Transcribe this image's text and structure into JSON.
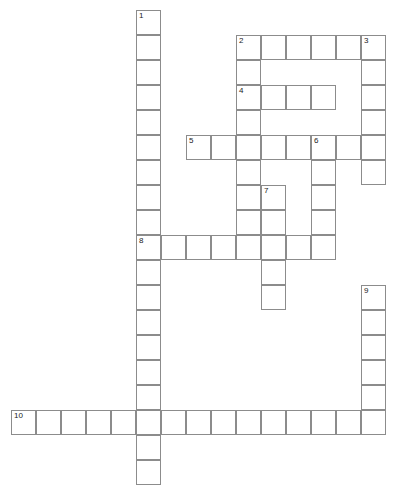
{
  "puzzle": {
    "title": "Crossword puzzle grid",
    "grid": {
      "cell_size": 25,
      "origin_x": 11,
      "origin_y": 10,
      "columns": 16,
      "rows": 19,
      "line_color": "#8c8c8c",
      "cell_fill": "#ffffff",
      "background": "#ffffff",
      "number_color": "#1a1a1a"
    },
    "entries": [
      {
        "number": "1",
        "direction": "down",
        "start_col": 5,
        "start_row": 0,
        "length": 18,
        "value": ""
      },
      {
        "number": "2",
        "direction": "across",
        "start_col": 9,
        "start_row": 1,
        "length": 5,
        "value": ""
      },
      {
        "number": "2",
        "direction": "down",
        "start_col": 9,
        "start_row": 1,
        "length": 8,
        "value": ""
      },
      {
        "number": "3",
        "direction": "down",
        "start_col": 14,
        "start_row": 1,
        "length": 6,
        "value": ""
      },
      {
        "number": "4",
        "direction": "across",
        "start_col": 9,
        "start_row": 3,
        "length": 4,
        "value": ""
      },
      {
        "number": "5",
        "direction": "across",
        "start_col": 7,
        "start_row": 5,
        "length": 7,
        "value": ""
      },
      {
        "number": "6",
        "direction": "down",
        "start_col": 12,
        "start_row": 5,
        "length": 5,
        "value": ""
      },
      {
        "number": "7",
        "direction": "down",
        "start_col": 10,
        "start_row": 7,
        "length": 5,
        "value": ""
      },
      {
        "number": "8",
        "direction": "across",
        "start_col": 5,
        "start_row": 9,
        "length": 8,
        "value": ""
      },
      {
        "number": "9",
        "direction": "down",
        "start_col": 14,
        "start_row": 11,
        "length": 6,
        "value": ""
      },
      {
        "number": "10",
        "direction": "across",
        "start_col": 0,
        "start_row": 16,
        "length": 15,
        "value": ""
      }
    ],
    "cells": [
      {
        "col": 5,
        "row": 0,
        "number": "1"
      },
      {
        "col": 5,
        "row": 1
      },
      {
        "col": 9,
        "row": 1,
        "number": "2"
      },
      {
        "col": 10,
        "row": 1
      },
      {
        "col": 11,
        "row": 1
      },
      {
        "col": 12,
        "row": 1
      },
      {
        "col": 13,
        "row": 1
      },
      {
        "col": 14,
        "row": 1,
        "number": "3"
      },
      {
        "col": 5,
        "row": 2
      },
      {
        "col": 9,
        "row": 2
      },
      {
        "col": 14,
        "row": 2
      },
      {
        "col": 5,
        "row": 3
      },
      {
        "col": 9,
        "row": 3,
        "number": "4"
      },
      {
        "col": 10,
        "row": 3
      },
      {
        "col": 11,
        "row": 3
      },
      {
        "col": 12,
        "row": 3
      },
      {
        "col": 14,
        "row": 3
      },
      {
        "col": 5,
        "row": 4
      },
      {
        "col": 9,
        "row": 4
      },
      {
        "col": 14,
        "row": 4
      },
      {
        "col": 5,
        "row": 5
      },
      {
        "col": 7,
        "row": 5,
        "number": "5"
      },
      {
        "col": 8,
        "row": 5
      },
      {
        "col": 9,
        "row": 5
      },
      {
        "col": 10,
        "row": 5
      },
      {
        "col": 11,
        "row": 5
      },
      {
        "col": 12,
        "row": 5,
        "number": "6"
      },
      {
        "col": 13,
        "row": 5
      },
      {
        "col": 14,
        "row": 5
      },
      {
        "col": 5,
        "row": 6
      },
      {
        "col": 9,
        "row": 6
      },
      {
        "col": 12,
        "row": 6
      },
      {
        "col": 14,
        "row": 6
      },
      {
        "col": 5,
        "row": 7
      },
      {
        "col": 9,
        "row": 7
      },
      {
        "col": 10,
        "row": 7,
        "number": "7"
      },
      {
        "col": 12,
        "row": 7
      },
      {
        "col": 5,
        "row": 8
      },
      {
        "col": 9,
        "row": 8
      },
      {
        "col": 10,
        "row": 8
      },
      {
        "col": 12,
        "row": 8
      },
      {
        "col": 5,
        "row": 9,
        "number": "8"
      },
      {
        "col": 6,
        "row": 9
      },
      {
        "col": 7,
        "row": 9
      },
      {
        "col": 8,
        "row": 9
      },
      {
        "col": 9,
        "row": 9
      },
      {
        "col": 10,
        "row": 9
      },
      {
        "col": 11,
        "row": 9
      },
      {
        "col": 12,
        "row": 9
      },
      {
        "col": 5,
        "row": 10
      },
      {
        "col": 10,
        "row": 10
      },
      {
        "col": 5,
        "row": 11
      },
      {
        "col": 10,
        "row": 11
      },
      {
        "col": 14,
        "row": 11,
        "number": "9"
      },
      {
        "col": 5,
        "row": 12
      },
      {
        "col": 14,
        "row": 12
      },
      {
        "col": 5,
        "row": 13
      },
      {
        "col": 14,
        "row": 13
      },
      {
        "col": 5,
        "row": 14
      },
      {
        "col": 14,
        "row": 14
      },
      {
        "col": 5,
        "row": 15
      },
      {
        "col": 14,
        "row": 15
      },
      {
        "col": 0,
        "row": 16,
        "number": "10"
      },
      {
        "col": 1,
        "row": 16
      },
      {
        "col": 2,
        "row": 16
      },
      {
        "col": 3,
        "row": 16
      },
      {
        "col": 4,
        "row": 16
      },
      {
        "col": 5,
        "row": 16
      },
      {
        "col": 6,
        "row": 16
      },
      {
        "col": 7,
        "row": 16
      },
      {
        "col": 8,
        "row": 16
      },
      {
        "col": 9,
        "row": 16
      },
      {
        "col": 10,
        "row": 16
      },
      {
        "col": 11,
        "row": 16
      },
      {
        "col": 12,
        "row": 16
      },
      {
        "col": 13,
        "row": 16
      },
      {
        "col": 14,
        "row": 16
      },
      {
        "col": 5,
        "row": 17
      },
      {
        "col": 5,
        "row": 18
      }
    ]
  }
}
